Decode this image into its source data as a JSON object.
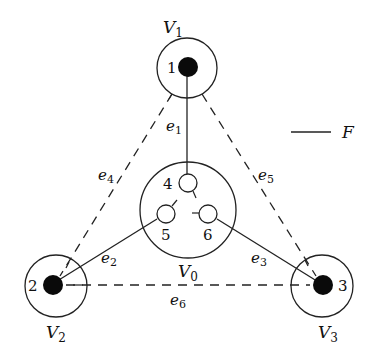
{
  "diagram": {
    "type": "graph",
    "colors": {
      "stroke": "#222222",
      "fill_dot": "#0a0a0a",
      "background": "#ffffff"
    },
    "legend": {
      "label": "F",
      "line": "solid"
    },
    "regions": [
      {
        "id": "V1",
        "name": "V",
        "sub": "1"
      },
      {
        "id": "V2",
        "name": "V",
        "sub": "2"
      },
      {
        "id": "V3",
        "name": "V",
        "sub": "3"
      },
      {
        "id": "V0",
        "name": "V",
        "sub": "0"
      }
    ],
    "nodes": [
      {
        "id": "1",
        "label": "1",
        "filled": true
      },
      {
        "id": "2",
        "label": "2",
        "filled": true
      },
      {
        "id": "3",
        "label": "3",
        "filled": true
      },
      {
        "id": "4",
        "label": "4",
        "filled": false
      },
      {
        "id": "5",
        "label": "5",
        "filled": false
      },
      {
        "id": "6",
        "label": "6",
        "filled": false
      }
    ],
    "edges": [
      {
        "id": "e1",
        "name": "e",
        "sub": "1",
        "from": "1",
        "to": "4",
        "style": "solid"
      },
      {
        "id": "e2",
        "name": "e",
        "sub": "2",
        "from": "5",
        "to": "2",
        "style": "solid"
      },
      {
        "id": "e3",
        "name": "e",
        "sub": "3",
        "from": "6",
        "to": "3",
        "style": "solid"
      },
      {
        "id": "e4",
        "name": "e",
        "sub": "4",
        "from": "1",
        "to": "2",
        "style": "dashed"
      },
      {
        "id": "e5",
        "name": "e",
        "sub": "5",
        "from": "1",
        "to": "3",
        "style": "dashed"
      },
      {
        "id": "e6",
        "name": "e",
        "sub": "6",
        "from": "2",
        "to": "3",
        "style": "dashed"
      }
    ]
  }
}
